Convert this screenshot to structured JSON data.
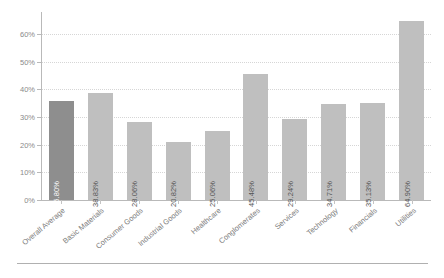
{
  "chart_data": {
    "type": "bar",
    "title": "",
    "subtitle": "",
    "xlabel": "",
    "ylabel": "",
    "ylim": [
      0,
      68
    ],
    "grid": true,
    "legend": "none",
    "orientation": "vertical",
    "value_label_rotation": "-90deg",
    "category_label_rotation": "-40deg",
    "categories": [
      "Overall Average",
      "Basic Materials",
      "Consumer Goods",
      "Industrial Goods",
      "Healthcare",
      "Conglomerates",
      "Services",
      "Technology",
      "Financials",
      "Utilities"
    ],
    "values": [
      35.8,
      38.83,
      28.06,
      20.82,
      25.06,
      45.48,
      29.24,
      34.71,
      35.13,
      64.9
    ],
    "value_labels": [
      "35.80%",
      "38.83%",
      "28.06%",
      "20.82%",
      "25.06%",
      "45.48%",
      "29.24%",
      "34.71%",
      "35.13%",
      "64.90%"
    ],
    "highlighted_index": 0,
    "yticks": [
      0,
      10,
      20,
      30,
      40,
      50,
      60
    ],
    "ytick_labels": [
      "0%",
      "10%",
      "20%",
      "30%",
      "40%",
      "50%",
      "60%"
    ],
    "colors": {
      "bar": "#bfbfbf",
      "bar_highlight": "#8e8e8e",
      "gridline": "#d6d6d6",
      "axis": "#b9b9b9",
      "tick_text": "#8a8a8a",
      "category_text": "#7d7d7d",
      "value_text": "#555555",
      "value_text_highlight": "#ffffff",
      "background": "#ffffff",
      "footer_rule": "#b0b0b0"
    }
  }
}
